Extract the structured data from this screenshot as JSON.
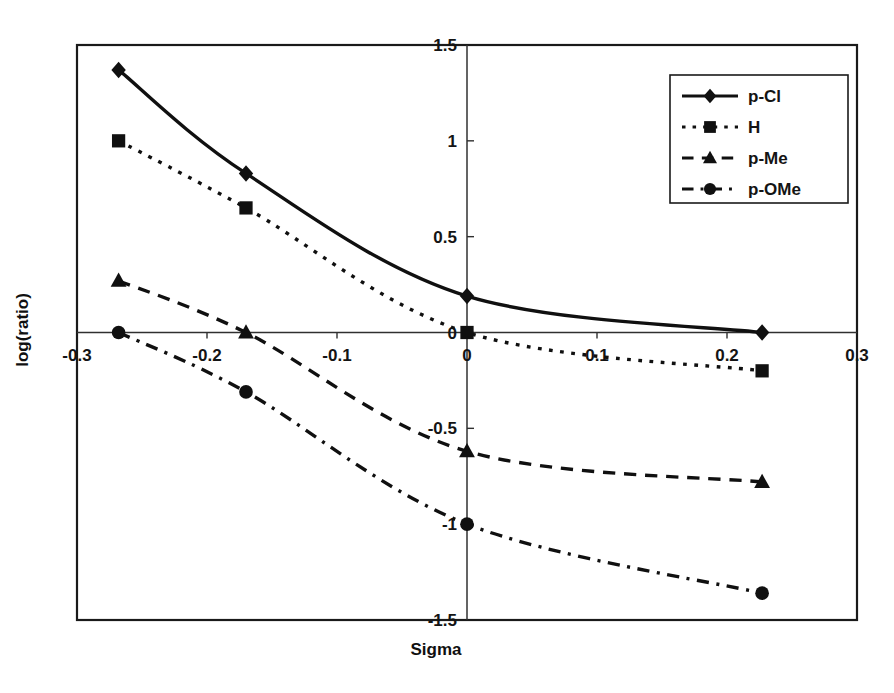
{
  "chart_data": {
    "type": "line",
    "title": "",
    "xlabel": "Sigma",
    "ylabel": "log(ratio)",
    "xlim": [
      -0.3,
      0.3
    ],
    "ylim": [
      -1.5,
      1.5
    ],
    "xticks": [
      -0.3,
      -0.2,
      -0.1,
      0,
      0.1,
      0.2,
      0.3
    ],
    "xtick_labels": [
      "-0.3",
      "-0.2",
      "-0.1",
      "0",
      "0.1",
      "0.2",
      "0.3"
    ],
    "yticks": [
      1.5,
      1,
      0.5,
      0,
      -0.5,
      -1,
      -1.5
    ],
    "ytick_labels": [
      "1.5",
      "1",
      "0.5",
      "0",
      "-0.5",
      "-1",
      "-1.5"
    ],
    "grid": false,
    "legend_position": "top-right",
    "x": [
      -0.268,
      -0.17,
      0,
      0.227
    ],
    "series": [
      {
        "name": "p-Cl",
        "marker": "diamond",
        "linestyle": "solid",
        "values": [
          1.37,
          0.83,
          0.19,
          0.0
        ]
      },
      {
        "name": "H",
        "marker": "square",
        "linestyle": "dotted",
        "values": [
          1.0,
          0.65,
          0.0,
          -0.2
        ]
      },
      {
        "name": "p-Me",
        "marker": "triangle",
        "linestyle": "dashed",
        "values": [
          0.27,
          0.0,
          -0.62,
          -0.78
        ]
      },
      {
        "name": "p-OMe",
        "marker": "circle",
        "linestyle": "dashdot",
        "values": [
          0.0,
          -0.31,
          -1.0,
          -1.36
        ]
      }
    ],
    "colors": {
      "series": "#101010",
      "axis": "#303030",
      "frame": "#1a1a1a",
      "background": "#ffffff"
    }
  }
}
